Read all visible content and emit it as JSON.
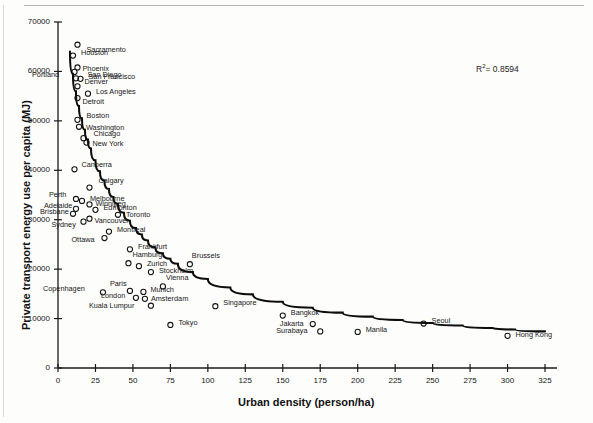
{
  "chart_data": {
    "type": "scatter",
    "title": "",
    "xlabel": "Urban density (person/ha)",
    "ylabel": "Private transport energy use per capita (MJ)",
    "xlim": [
      0,
      325
    ],
    "ylim": [
      0,
      70000
    ],
    "xticks": [
      0,
      25,
      50,
      75,
      100,
      125,
      150,
      175,
      200,
      225,
      250,
      275,
      300,
      325
    ],
    "yticks": [
      0,
      10000,
      20000,
      30000,
      40000,
      50000,
      60000,
      70000
    ],
    "grid": false,
    "legend": false,
    "annotations": [
      {
        "name": "r-squared",
        "text": "R2 = 0.8594",
        "r2_value": "0.8594",
        "symbol": "R",
        "superscript": "2",
        "equals": "= 0.8594"
      }
    ],
    "fit_curve": {
      "type": "power-law trendline",
      "description": "decaying power curve fitted through all points",
      "points": [
        [
          8,
          64000
        ],
        [
          10,
          59500
        ],
        [
          12,
          56000
        ],
        [
          14,
          53000
        ],
        [
          16,
          50500
        ],
        [
          18,
          48200
        ],
        [
          20,
          46200
        ],
        [
          22,
          44400
        ],
        [
          25,
          42000
        ],
        [
          28,
          39800
        ],
        [
          31,
          37900
        ],
        [
          34,
          36200
        ],
        [
          37,
          34600
        ],
        [
          40,
          33200
        ],
        [
          44,
          31400
        ],
        [
          48,
          29800
        ],
        [
          52,
          28300
        ],
        [
          56,
          27000
        ],
        [
          60,
          25800
        ],
        [
          65,
          24400
        ],
        [
          70,
          23200
        ],
        [
          75,
          22100
        ],
        [
          80,
          21100
        ],
        [
          90,
          19400
        ],
        [
          100,
          18000
        ],
        [
          115,
          16300
        ],
        [
          130,
          14900
        ],
        [
          150,
          13400
        ],
        [
          170,
          12200
        ],
        [
          190,
          11200
        ],
        [
          210,
          10400
        ],
        [
          230,
          9700
        ],
        [
          250,
          9100
        ],
        [
          270,
          8600
        ],
        [
          290,
          8100
        ],
        [
          305,
          7800
        ],
        [
          325,
          7400
        ]
      ]
    },
    "points": [
      {
        "label": "Sacramento",
        "x": 13,
        "y": 65400,
        "lx": 9,
        "ly": 5
      },
      {
        "label": "Houston",
        "x": 10,
        "y": 63200,
        "lx": 8,
        "ly": -3
      },
      {
        "label": "San Diego",
        "x": 13,
        "y": 60800,
        "lx": 10,
        "ly": 8
      },
      {
        "label": "Phoenix",
        "x": 11,
        "y": 59900,
        "lx": 8,
        "ly": -3
      },
      {
        "label": "Portland",
        "x": 12,
        "y": 58600,
        "lx": -44,
        "ly": -3
      },
      {
        "label": "San Francisco",
        "x": 15,
        "y": 58500,
        "lx": 8,
        "ly": -2
      },
      {
        "label": "Denver",
        "x": 13,
        "y": 57000,
        "lx": 7,
        "ly": -4
      },
      {
        "label": "Los Angeles",
        "x": 20,
        "y": 55500,
        "lx": 8,
        "ly": -2
      },
      {
        "label": "Detroit",
        "x": 13,
        "y": 54600,
        "lx": 5,
        "ly": 4
      },
      {
        "label": "Boston",
        "x": 13,
        "y": 50200,
        "lx": 9,
        "ly": -4
      },
      {
        "label": "Washington",
        "x": 14,
        "y": 48800,
        "lx": 7,
        "ly": 1
      },
      {
        "label": "Chicago",
        "x": 17,
        "y": 46500,
        "lx": 10,
        "ly": -4
      },
      {
        "label": "New York",
        "x": 19,
        "y": 45600,
        "lx": 6,
        "ly": 1
      },
      {
        "label": "Canberra",
        "x": 11,
        "y": 40200,
        "lx": 7,
        "ly": -4
      },
      {
        "label": "Calgary",
        "x": 21,
        "y": 36500,
        "lx": 9,
        "ly": -7
      },
      {
        "label": "Perth",
        "x": 12,
        "y": 34200,
        "lx": -27,
        "ly": -4
      },
      {
        "label": "Melbourne",
        "x": 16,
        "y": 33800,
        "lx": 8,
        "ly": -2
      },
      {
        "label": "Winnipeg",
        "x": 21,
        "y": 33100,
        "lx": 6,
        "ly": 0
      },
      {
        "label": "Adelaide",
        "x": 12,
        "y": 32200,
        "lx": -32,
        "ly": -3
      },
      {
        "label": "Edmonton",
        "x": 25,
        "y": 32000,
        "lx": 8,
        "ly": -2
      },
      {
        "label": "Brisbane",
        "x": 10,
        "y": 31200,
        "lx": -33,
        "ly": -2
      },
      {
        "label": "Toronto",
        "x": 40,
        "y": 31000,
        "lx": 8,
        "ly": 0
      },
      {
        "label": "Vancouver",
        "x": 21,
        "y": 30200,
        "lx": 5,
        "ly": 2
      },
      {
        "label": "Sydney",
        "x": 17,
        "y": 29600,
        "lx": -32,
        "ly": 3
      },
      {
        "label": "Montreal",
        "x": 34,
        "y": 27600,
        "lx": 8,
        "ly": -2
      },
      {
        "label": "Ottawa",
        "x": 31,
        "y": 26300,
        "lx": -33,
        "ly": 2
      },
      {
        "label": "Frankfurt",
        "x": 48,
        "y": 24000,
        "lx": 8,
        "ly": -2
      },
      {
        "label": "Hamburg",
        "x": 47,
        "y": 21200,
        "lx": 4,
        "ly": -8
      },
      {
        "label": "Brussels",
        "x": 88,
        "y": 21000,
        "lx": 2,
        "ly": -8
      },
      {
        "label": "Zurich",
        "x": 54,
        "y": 20600,
        "lx": 8,
        "ly": -2
      },
      {
        "label": "Stockholm",
        "x": 62,
        "y": 19400,
        "lx": 8,
        "ly": -1
      },
      {
        "label": "Vienna",
        "x": 70,
        "y": 16500,
        "lx": 3,
        "ly": -8
      },
      {
        "label": "Paris",
        "x": 48,
        "y": 15600,
        "lx": -20,
        "ly": -7
      },
      {
        "label": "Copenhagen",
        "x": 30,
        "y": 15300,
        "lx": -60,
        "ly": -3
      },
      {
        "label": "Munich",
        "x": 57,
        "y": 15400,
        "lx": 7,
        "ly": -2
      },
      {
        "label": "London",
        "x": 52,
        "y": 14200,
        "lx": -35,
        "ly": -2
      },
      {
        "label": "Amsterdam",
        "x": 58,
        "y": 14000,
        "lx": 6,
        "ly": 0
      },
      {
        "label": "Kuala Lumpur",
        "x": 62,
        "y": 12600,
        "lx": -62,
        "ly": 0
      },
      {
        "label": "Singapore",
        "x": 105,
        "y": 12500,
        "lx": 8,
        "ly": -3
      },
      {
        "label": "Tokyo",
        "x": 75,
        "y": 8700,
        "lx": 8,
        "ly": -2
      },
      {
        "label": "Bangkok",
        "x": 150,
        "y": 10600,
        "lx": 8,
        "ly": -3
      },
      {
        "label": "Jakarta",
        "x": 170,
        "y": 8900,
        "lx": -33,
        "ly": 0
      },
      {
        "label": "Surabaya",
        "x": 175,
        "y": 7400,
        "lx": -44,
        "ly": 0
      },
      {
        "label": "Manila",
        "x": 200,
        "y": 7300,
        "lx": 8,
        "ly": -2
      },
      {
        "label": "Seoul",
        "x": 244,
        "y": 9000,
        "lx": 8,
        "ly": -3
      },
      {
        "label": "Hong Kong",
        "x": 300,
        "y": 6500,
        "lx": 8,
        "ly": -1
      }
    ]
  }
}
